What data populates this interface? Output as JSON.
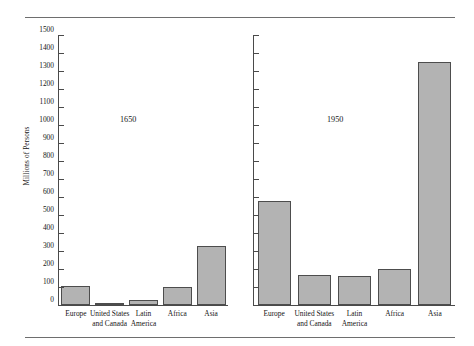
{
  "figure": {
    "y_axis_title": "Millions of Persons",
    "tick_labels": [
      "1500",
      "1400",
      "1300",
      "1200",
      "1100",
      "1000",
      "900",
      "800",
      "700",
      "600",
      "500",
      "400",
      "300",
      "200",
      "100",
      "0"
    ],
    "panel_titles": [
      "1650",
      "1950"
    ],
    "categories_display": [
      [
        "Europe",
        ""
      ],
      [
        "United States",
        "and Canada"
      ],
      [
        "Latin",
        "America"
      ],
      [
        "Africa",
        ""
      ],
      [
        "Asia",
        ""
      ]
    ],
    "bar_fill_color": "#b3b3b3",
    "bar_edge_color": "#4d4d4d"
  },
  "chart_data": {
    "type": "bar",
    "title": "",
    "subtitle": "",
    "xlabel": "",
    "ylabel": "Millions of Persons",
    "ylim": [
      0,
      1500
    ],
    "ytick_step": 100,
    "yticks": [
      0,
      100,
      200,
      300,
      400,
      500,
      600,
      700,
      800,
      900,
      1000,
      1100,
      1200,
      1300,
      1400,
      1500
    ],
    "grid": false,
    "legend": "none",
    "panels": [
      {
        "name": "1650",
        "categories": [
          "Europe",
          "United States and Canada",
          "Latin America",
          "Africa",
          "Asia"
        ],
        "values": [
          105,
          12,
          30,
          100,
          330
        ]
      },
      {
        "name": "1950",
        "categories": [
          "Europe",
          "United States and Canada",
          "Latin America",
          "Africa",
          "Asia"
        ],
        "values": [
          580,
          166,
          162,
          198,
          1350
        ]
      }
    ],
    "categories": [
      "Europe",
      "United States and Canada",
      "Latin America",
      "Africa",
      "Asia"
    ],
    "series": [
      {
        "name": "1650",
        "values": [
          105,
          12,
          30,
          100,
          330
        ]
      },
      {
        "name": "1950",
        "values": [
          580,
          166,
          162,
          198,
          1350
        ]
      }
    ]
  }
}
